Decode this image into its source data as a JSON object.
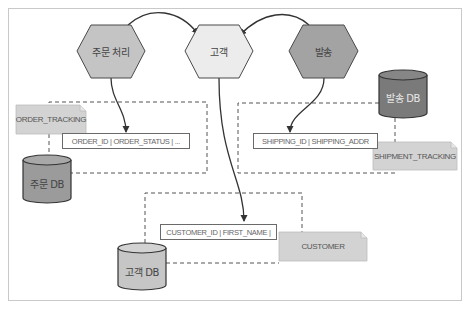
{
  "diagram": {
    "services": [
      {
        "id": "order",
        "label": "주문 처리",
        "fill": "#c4c4c4"
      },
      {
        "id": "customer",
        "label": "고객",
        "fill": "#ececec"
      },
      {
        "id": "shipping",
        "label": "발송",
        "fill": "#a3a3a3"
      }
    ],
    "databases": [
      {
        "id": "order_db",
        "label": "주문 DB",
        "fill": "#9b9b9b"
      },
      {
        "id": "shipping_db",
        "label": "발송 DB",
        "fill": "#7a7a7a"
      },
      {
        "id": "customer_db",
        "label": "고객 DB",
        "fill": "#c6c6c6"
      }
    ],
    "tables": [
      {
        "id": "order_tracking",
        "name": "ORDER_TRACKING",
        "columns": "ORDER_ID | ORDER_STATUS | ..."
      },
      {
        "id": "shipment_tracking",
        "name": "SHIPMENT_TRACKING",
        "columns": "SHIPPING_ID | SHIPPING_ADDR"
      },
      {
        "id": "customer",
        "name": "CUSTOMER",
        "columns": "CUSTOMER_ID | FIRST_NAME |"
      }
    ],
    "connections": [
      {
        "from": "주문 처리",
        "to": "고객"
      },
      {
        "from": "발송",
        "to": "고객"
      },
      {
        "from": "주문 처리",
        "to": "ORDER_ID | ORDER_STATUS | ..."
      },
      {
        "from": "발송",
        "to": "SHIPPING_ID | SHIPPING_ADDR"
      },
      {
        "from": "고객",
        "to": "CUSTOMER_ID | FIRST_NAME |"
      }
    ],
    "colors": {
      "stroke": "#4a4a4a",
      "note_fill": "#d3d3d3",
      "dash": "#555555",
      "frame": "#c9c9c9"
    }
  }
}
